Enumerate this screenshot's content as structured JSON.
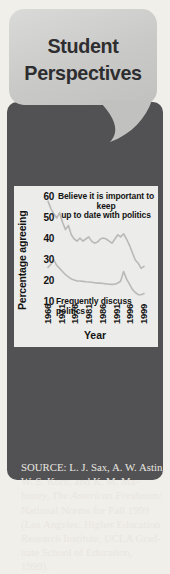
{
  "bubble": {
    "title_line1": "Student",
    "title_line2": "Perspectives"
  },
  "panel": {
    "heading_line1": "STUDENT INTEREST",
    "heading_line2": "IN POLITICS"
  },
  "chart_data": {
    "type": "line",
    "title": "",
    "xlabel": "Year",
    "ylabel": "Percentage agreeing",
    "ylim": [
      10,
      60
    ],
    "yticks": [
      60,
      50,
      40,
      30,
      20,
      10
    ],
    "xticks": [
      "1966",
      "1971",
      "1976",
      "1981",
      "1986",
      "1991",
      "1996",
      "1999"
    ],
    "xlim": [
      1966,
      1999
    ],
    "grid": false,
    "legend_position": "annotations-on-plot",
    "line_color": "#b9b9b9",
    "series": [
      {
        "name": "Believe it is important to keep up to date with politics",
        "label_line1": "Believe it is important to keep",
        "label_line2": "up to date with politics",
        "x": [
          1966,
          1967,
          1968,
          1969,
          1970,
          1971,
          1972,
          1973,
          1974,
          1975,
          1976,
          1977,
          1978,
          1979,
          1980,
          1981,
          1982,
          1983,
          1984,
          1985,
          1986,
          1987,
          1988,
          1989,
          1990,
          1991,
          1992,
          1993,
          1994,
          1995,
          1996,
          1997,
          1998,
          1999
        ],
        "values": [
          58,
          54.5,
          52,
          50,
          52.5,
          48,
          44.5,
          46.5,
          42,
          40,
          39,
          40.5,
          39,
          40,
          41,
          39,
          38,
          38.5,
          40,
          40.5,
          40,
          39,
          38,
          40,
          42,
          41,
          42.5,
          40,
          37,
          33.5,
          30,
          28.5,
          26,
          27
        ]
      },
      {
        "name": "Frequently discuss politics",
        "label": "Frequently discuss politics",
        "x": [
          1966,
          1967,
          1968,
          1969,
          1970,
          1971,
          1972,
          1973,
          1974,
          1975,
          1976,
          1977,
          1978,
          1979,
          1980,
          1981,
          1982,
          1983,
          1984,
          1985,
          1986,
          1987,
          1988,
          1989,
          1990,
          1991,
          1992,
          1993,
          1994,
          1995,
          1996,
          1997,
          1998,
          1999
        ],
        "values": [
          26.5,
          28,
          30,
          27.5,
          26,
          24.5,
          23,
          22,
          21,
          20.5,
          20,
          20,
          19.8,
          19.6,
          19.5,
          19.4,
          19.2,
          19,
          19,
          18.8,
          18.6,
          18.5,
          18.4,
          18.5,
          19,
          20,
          24.5,
          21,
          18.5,
          16,
          14.5,
          13.5,
          13.5,
          14
        ]
      }
    ]
  },
  "source": {
    "prefix": "SOURCE: L. J. Sax, A. W. Astin,\nW. S. Korn, and K. M. Ma-\nhoney, ",
    "italic": "The American Freshman:",
    "suffix": "\nNational Norms for Fall 1999\n(Los Angeles: Higher Education\nResearch Institute, UCLA Grad-\nuate School of Education,\n1999)."
  },
  "colors": {
    "dark_panel": "#525254",
    "bubble": "#cbcbc9",
    "bubble_text": "#2e2e30",
    "heading_text": "#96969a",
    "chart_bg": "#ececea",
    "line": "#b9b9b9",
    "source_text": "#e9e6e0",
    "page_bg": "#f1efea"
  }
}
